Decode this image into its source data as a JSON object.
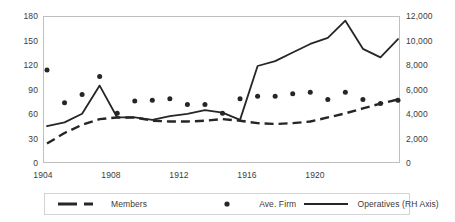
{
  "chart_data": {
    "type": "line",
    "title": "",
    "xlabel": "",
    "ylabel": "",
    "y2label": "",
    "grid": false,
    "legend_position": "bottom",
    "x": [
      1904,
      1905,
      1906,
      1907,
      1908,
      1909,
      1910,
      1911,
      1912,
      1913,
      1914,
      1915,
      1916,
      1917,
      1918,
      1919,
      1920,
      1921,
      1922,
      1923,
      1924
    ],
    "xticks": [
      "1904",
      "1908",
      "1912",
      "1916",
      "1920"
    ],
    "xtick_years": [
      1904,
      1908,
      1912,
      1916,
      1920
    ],
    "yticks_left": [
      "0",
      "30",
      "60",
      "90",
      "120",
      "150",
      "180"
    ],
    "ylim_left": [
      0,
      180
    ],
    "yticks_right": [
      "0",
      "2,000",
      "4,000",
      "6,000",
      "8,000",
      "10,000",
      "12,000"
    ],
    "ylim_right": [
      0,
      12000
    ],
    "series": [
      {
        "name": "Members",
        "axis": "left",
        "style": "dashed-line",
        "color": "#262626",
        "values": [
          25,
          38,
          48,
          55,
          57,
          57,
          53,
          52,
          52,
          53,
          55,
          53,
          50,
          49,
          50,
          52,
          57,
          62,
          68,
          74,
          79
        ]
      },
      {
        "name": "Ave. Firm",
        "axis": "left",
        "style": "dots",
        "color": "#262626",
        "values": [
          115,
          75,
          85,
          107,
          62,
          77,
          78,
          80,
          73,
          73,
          62,
          80,
          83,
          83,
          86,
          88,
          79,
          88,
          79,
          74,
          78
        ]
      },
      {
        "name": "Operatives (RH Axis)",
        "axis": "right",
        "style": "solid-line",
        "color": "#262626",
        "values": [
          3100,
          3400,
          4100,
          6400,
          3800,
          3800,
          3600,
          3900,
          4100,
          4400,
          4200,
          3600,
          8000,
          8400,
          9100,
          9800,
          10300,
          11700,
          9400,
          8700,
          10200
        ]
      }
    ]
  },
  "legend": {
    "items": [
      {
        "label": "Members",
        "marker": "dashed-line-swatch"
      },
      {
        "label": "Ave. Firm",
        "marker": "dot-swatch"
      },
      {
        "label": "Operatives (RH Axis)",
        "marker": "solid-line-swatch"
      }
    ]
  }
}
